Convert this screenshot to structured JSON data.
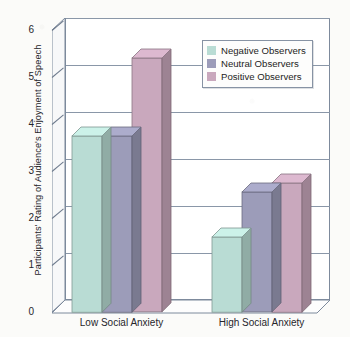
{
  "chart_data": {
    "type": "bar",
    "title": "",
    "subtitle": "",
    "xlabel": "",
    "ylabel": "Participants' Rating of Audience's Enjoyment of Speech",
    "categories": [
      "Low Social Anxiety",
      "High Social Anxiety"
    ],
    "series": [
      {
        "name": "Negative Observers",
        "color": "#b9dcd4",
        "values": [
          3.75,
          1.6
        ]
      },
      {
        "name": "Neutral Observers",
        "color": "#9c9cb9",
        "values": [
          3.75,
          2.55
        ]
      },
      {
        "name": "Positive Observers",
        "color": "#c9a8bd",
        "values": [
          5.4,
          2.75
        ]
      }
    ],
    "ylim": [
      0,
      6
    ],
    "yticks": [
      "6",
      "5",
      "4",
      "3",
      "2",
      "1",
      "0"
    ],
    "ytick_values": [
      6,
      5,
      4,
      3,
      2,
      1,
      0
    ],
    "grid": true,
    "legend_position": "top-right",
    "style": "3d-bar"
  },
  "legend": {
    "items": [
      {
        "label": "Negative Observers",
        "color": "#b9dcd4"
      },
      {
        "label": "Neutral Observers",
        "color": "#9c9cb9"
      },
      {
        "label": "Positive Observers",
        "color": "#c9a8bd"
      }
    ]
  },
  "axes": {
    "y_title": "Participants' Rating of Audience's Enjoyment of Speech",
    "y_labels": [
      "6",
      "5",
      "4",
      "3",
      "2",
      "1",
      "0"
    ],
    "x_labels": [
      "Low Social Anxiety",
      "High Social Anxiety"
    ]
  },
  "colors": {
    "negative": "#b9dcd4",
    "neutral": "#9c9cb9",
    "positive": "#c9a8bd",
    "axis": "#7d8a9c",
    "background": "#fbfbf9",
    "text": "#26262b"
  }
}
